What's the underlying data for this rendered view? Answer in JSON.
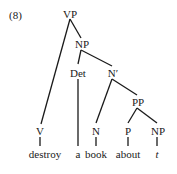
{
  "example_number": "(8)",
  "nodes": {
    "vp": "VP",
    "np_top": "NP",
    "det": "Det",
    "nbar": "N′",
    "pp": "PP",
    "v": "V",
    "n": "N",
    "p": "P",
    "np_low": "NP"
  },
  "words": {
    "destroy": "destroy",
    "a": "a",
    "book": "book",
    "about": "about",
    "trace": "t"
  }
}
